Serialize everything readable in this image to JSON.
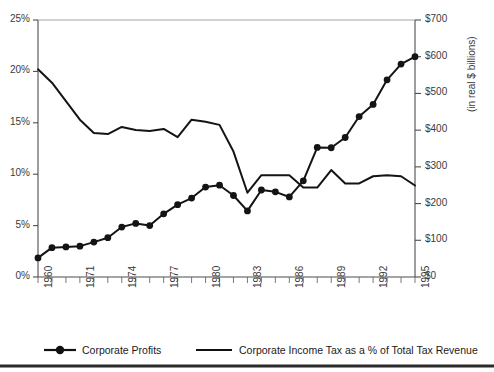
{
  "chart_data": {
    "type": "line",
    "title": "",
    "xlabel": "",
    "grid": false,
    "legend_position": "bottom",
    "x_axis": {
      "ticks_every": 1,
      "label_every": 3,
      "start": 1968,
      "end": 1995,
      "labels": [
        "1960",
        "1971",
        "1974",
        "1977",
        "1980",
        "1983",
        "1986",
        "1989",
        "1992",
        "1995"
      ]
    },
    "y_left": {
      "label": "",
      "ticks": [
        "0%",
        "5%",
        "10%",
        "15%",
        "20%",
        "25%"
      ],
      "values": [
        0,
        5,
        10,
        15,
        20,
        25
      ],
      "ylim": [
        0,
        25
      ]
    },
    "y_right": {
      "label": "(in real $ billions)",
      "ticks": [
        "$0",
        "$100",
        "$200",
        "$300",
        "$400",
        "$500",
        "$600",
        "$700"
      ],
      "values": [
        0,
        100,
        200,
        300,
        400,
        500,
        600,
        700
      ],
      "ylim": [
        0,
        700
      ]
    },
    "x": [
      1968,
      1969,
      1970,
      1971,
      1972,
      1973,
      1974,
      1975,
      1976,
      1977,
      1978,
      1979,
      1980,
      1981,
      1982,
      1983,
      1984,
      1985,
      1986,
      1987,
      1988,
      1989,
      1990,
      1991,
      1992,
      1993,
      1994,
      1995
    ],
    "series": [
      {
        "name": "Corporate Profits",
        "axis": "right",
        "unit": "real $ billions",
        "marker": "filled-circle",
        "values": [
          52,
          80,
          82,
          84,
          95,
          107,
          136,
          146,
          140,
          172,
          197,
          215,
          245,
          250,
          222,
          180,
          237,
          232,
          218,
          262,
          353,
          352,
          380,
          437,
          470,
          537,
          580,
          600
        ]
      },
      {
        "name": "Corporate Income Tax as a % of Total Tax Revenue",
        "axis": "left",
        "unit": "percent",
        "marker": "none",
        "values": [
          20.2,
          18.9,
          17.1,
          15.3,
          14.0,
          13.9,
          14.6,
          14.3,
          14.2,
          14.4,
          13.6,
          15.3,
          15.1,
          14.8,
          12.2,
          8.2,
          9.9,
          9.9,
          9.9,
          8.7,
          8.7,
          10.4,
          9.1,
          9.1,
          9.8,
          9.9,
          9.8,
          8.9
        ]
      }
    ]
  },
  "legend": {
    "items": [
      {
        "label": "Corporate Profits",
        "style": "line-with-marker"
      },
      {
        "label": "Corporate Income Tax as a % of Total Tax Revenue",
        "style": "line"
      }
    ]
  }
}
